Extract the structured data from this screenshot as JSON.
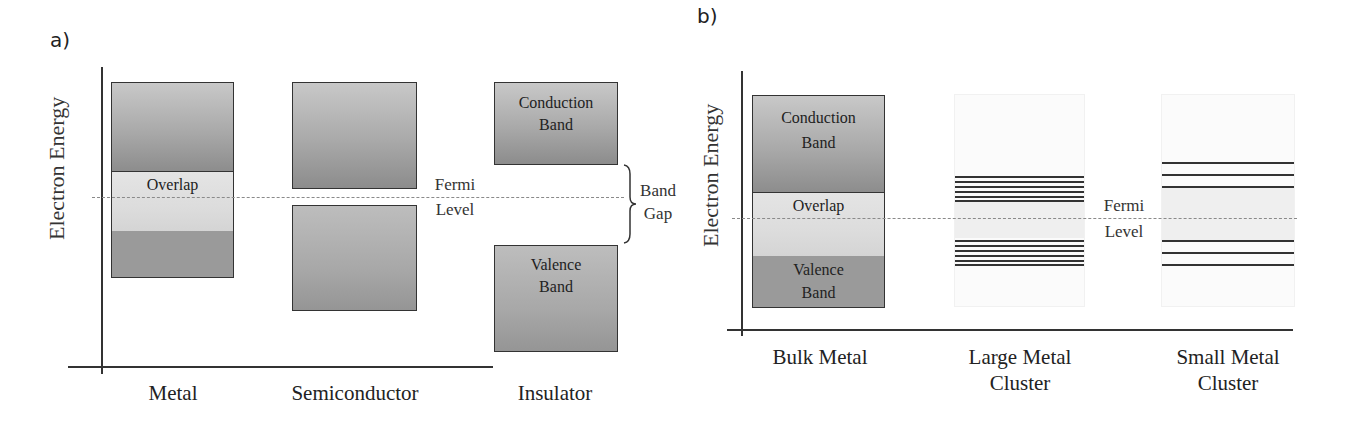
{
  "panel_a": {
    "label": "a)",
    "ylabel": "Electron Energy",
    "fermi_label_line1": "Fermi",
    "fermi_label_line2": "Level",
    "band_gap_line1": "Band",
    "band_gap_line2": "Gap",
    "columns": [
      {
        "label": "Metal",
        "overlap_label": "Overlap"
      },
      {
        "label": "Semiconductor"
      },
      {
        "label": "Insulator",
        "conduction_line1": "Conduction",
        "conduction_line2": "Band",
        "valence_line1": "Valence",
        "valence_line2": "Band"
      }
    ]
  },
  "panel_b": {
    "label": "b)",
    "ylabel": "Electron Energy",
    "fermi_label_line1": "Fermi",
    "fermi_label_line2": "Level",
    "columns": [
      {
        "label_line1": "Bulk Metal",
        "label_line2": "",
        "conduction_line1": "Conduction",
        "conduction_line2": "Band",
        "overlap_label": "Overlap",
        "valence_line1": "Valence",
        "valence_line2": "Band"
      },
      {
        "label_line1": "Large Metal",
        "label_line2": "Cluster",
        "levels_above": 6,
        "levels_below": 6
      },
      {
        "label_line1": "Small Metal",
        "label_line2": "Cluster",
        "levels_above": 3,
        "levels_below": 3
      }
    ]
  },
  "colors": {
    "band_fill": "#a9a9a9",
    "overlap_fill": "#dcdcdc",
    "line": "#333333",
    "fermi_dash": "#8a8a8a"
  }
}
